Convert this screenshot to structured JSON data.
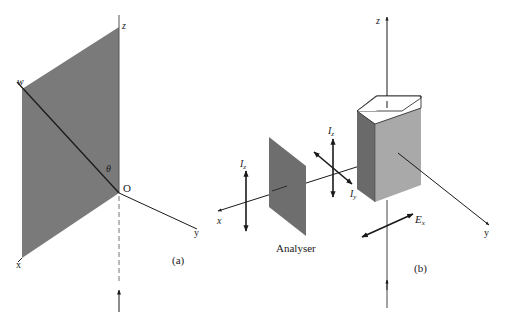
{
  "panel_a": {
    "caption": "(a)",
    "labels": {
      "z": "z",
      "w": "w",
      "theta": "θ",
      "origin": "O",
      "y": "y",
      "x": "x"
    }
  },
  "panel_b": {
    "caption": "(b)",
    "analyser_label": "Analyser",
    "labels": {
      "z": "z",
      "x": "x",
      "y": "y",
      "Iz_left": "I",
      "Iz_left_sub": "z",
      "Iz_mid": "I",
      "Iz_mid_sub": "z",
      "Iy_mid": "I",
      "Iy_mid_sub": "y",
      "Ex": "E",
      "Ex_sub": "x"
    }
  },
  "colors": {
    "plane": "#7a7a7a",
    "analyser": "#6e6e6e",
    "box_front": "#a9a9a9",
    "box_side": "#6a6a6a",
    "box_top": "#ffffff",
    "line": "#1a1a1a"
  }
}
